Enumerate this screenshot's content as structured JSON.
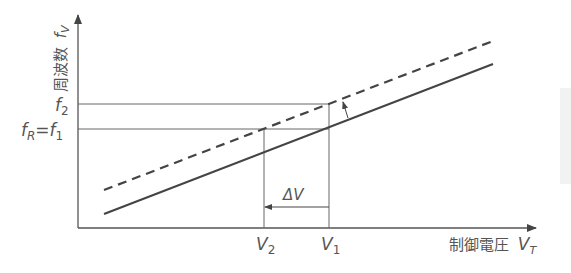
{
  "diagram": {
    "type": "line-plot-schematic",
    "y_axis": {
      "label": "周波数",
      "symbol_base": "f",
      "symbol_sub": "V"
    },
    "x_axis": {
      "label": "制御電圧",
      "symbol_base": "V",
      "symbol_sub": "T"
    },
    "y_ticks": [
      {
        "base": "f",
        "sub": "2"
      },
      {
        "left_base": "f",
        "left_sub": "R",
        "eq": "=",
        "base": "f",
        "sub": "1"
      }
    ],
    "x_ticks": [
      {
        "base": "V",
        "sub": "2"
      },
      {
        "base": "V",
        "sub": "1"
      }
    ],
    "delta_label": "ΔV",
    "lines": [
      {
        "name": "original",
        "style": "solid"
      },
      {
        "name": "shifted",
        "style": "dashed"
      }
    ],
    "colors": {
      "line": "#444444",
      "thin": "#666666",
      "text": "#555555"
    }
  }
}
